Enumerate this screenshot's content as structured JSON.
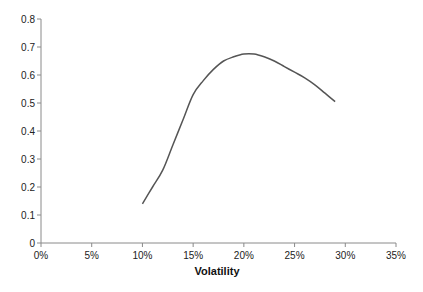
{
  "chart_data": {
    "type": "line",
    "title": "",
    "xlabel": "Volatility",
    "ylabel": "",
    "xlim": [
      0,
      35
    ],
    "ylim": [
      0,
      0.8
    ],
    "x_ticks": [
      "0%",
      "5%",
      "10%",
      "15%",
      "20%",
      "25%",
      "30%",
      "35%"
    ],
    "y_ticks": [
      "0",
      "0.1",
      "0.2",
      "0.3",
      "0.4",
      "0.5",
      "0.6",
      "0.7",
      "0.8"
    ],
    "grid": false,
    "legend": null,
    "series": [
      {
        "name": "Series 1",
        "color": "#555555",
        "x": [
          10,
          11,
          12,
          13,
          14,
          15,
          16,
          17,
          18,
          19,
          20,
          21,
          22,
          23,
          24,
          25,
          26,
          27,
          28,
          29
        ],
        "values": [
          0.14,
          0.2,
          0.26,
          0.35,
          0.44,
          0.53,
          0.58,
          0.62,
          0.65,
          0.665,
          0.675,
          0.675,
          0.665,
          0.65,
          0.63,
          0.61,
          0.59,
          0.565,
          0.535,
          0.505
        ]
      }
    ]
  },
  "axes": {
    "x_title": "Volatility"
  }
}
